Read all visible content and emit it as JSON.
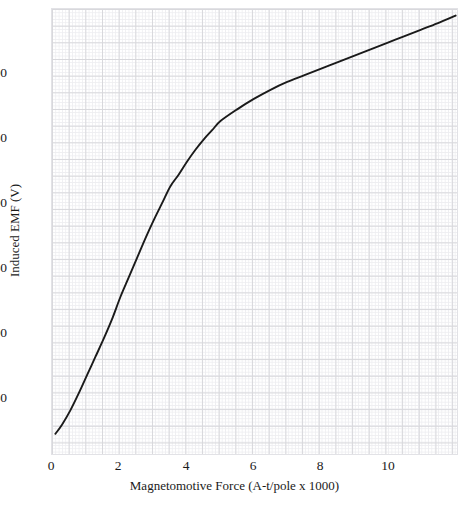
{
  "chart_data": {
    "type": "line",
    "title": "",
    "xlabel": "Magnetomotive Force (A-t/pole x 1000)",
    "ylabel": "Induced EMF (V)",
    "xlim": [
      -0.05,
      12.15
    ],
    "ylim": [
      0,
      343
    ],
    "grid": true,
    "legend": null,
    "xticks": [
      0,
      2,
      4,
      6,
      8,
      10
    ],
    "xtick_labels": [
      "0",
      "2",
      "4",
      "6",
      "8",
      "10"
    ],
    "yticks": [
      50,
      100,
      150,
      200,
      250,
      300
    ],
    "ytick_labels": [
      "50",
      "100",
      "150",
      "200",
      "250",
      "300"
    ],
    "series": [
      {
        "name": "Magnetization curve",
        "color": "#1a1a1a",
        "x": [
          0.05,
          0.25,
          0.5,
          0.75,
          1.0,
          1.25,
          1.5,
          1.75,
          2.0,
          2.25,
          2.5,
          2.75,
          3.0,
          3.25,
          3.5,
          3.75,
          4.0,
          4.25,
          4.5,
          4.75,
          5.0,
          5.5,
          6.0,
          6.5,
          7.0,
          7.5,
          8.0,
          8.5,
          9.0,
          9.5,
          10.0,
          10.5,
          11.0,
          11.5,
          12.05
        ],
        "y": [
          17,
          24,
          35,
          48,
          62,
          76,
          90,
          105,
          122,
          137,
          152,
          167,
          181,
          194,
          207,
          216,
          226,
          235,
          243,
          250,
          257,
          266,
          274,
          281,
          287,
          292,
          297,
          302,
          307,
          312,
          317,
          322,
          327,
          332,
          338
        ]
      }
    ]
  }
}
